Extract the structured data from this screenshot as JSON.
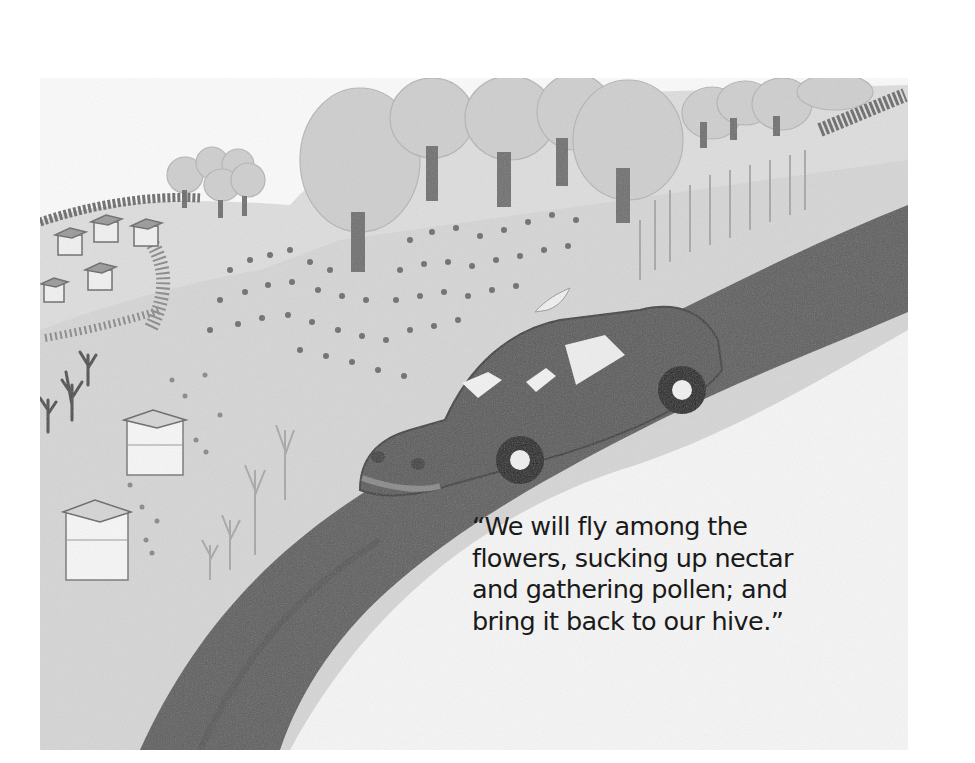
{
  "page": {
    "type": "storybook-illustration",
    "caption_lines": [
      "“We will fly among the",
      "flowers, sucking up nectar",
      "and gathering pollen; and",
      "bring it back to our hive.”"
    ]
  },
  "scene": {
    "elements": [
      "road",
      "car",
      "beehives",
      "trees",
      "flower-fields",
      "bees",
      "bushes"
    ],
    "palette": {
      "paper": "#ffffff",
      "ground": "#d9d9d9",
      "road": "#5a5a5a",
      "car": "#595959",
      "trees": "#c9c9c9",
      "trunks": "#6f6f6f",
      "text": "#1a1a1a"
    }
  }
}
